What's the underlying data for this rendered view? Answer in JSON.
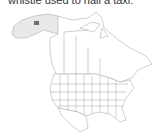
{
  "caption": "whistle used to hail a taxi.",
  "map": {
    "region": "North America",
    "highlight_region": "Alaska",
    "colors": {
      "background": "#ffffff",
      "borders": "#999999",
      "range_light": "#e6e6e6",
      "range_dark": "#6e6e6e"
    }
  }
}
